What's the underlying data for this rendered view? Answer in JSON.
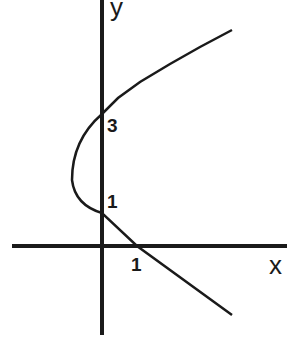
{
  "diagram": {
    "axes": {
      "x_label": "x",
      "y_label": "y"
    },
    "ticks": {
      "y_tick_1": "1",
      "y_tick_3": "3",
      "x_tick_1": "1"
    },
    "curve": {
      "type": "parabola",
      "opens": "right",
      "vertex": [
        -1,
        2
      ],
      "y_intercepts": [
        1,
        3
      ],
      "x_intercept": 1
    },
    "colors": {
      "line": "#1a1a1a",
      "background": "#ffffff"
    }
  }
}
